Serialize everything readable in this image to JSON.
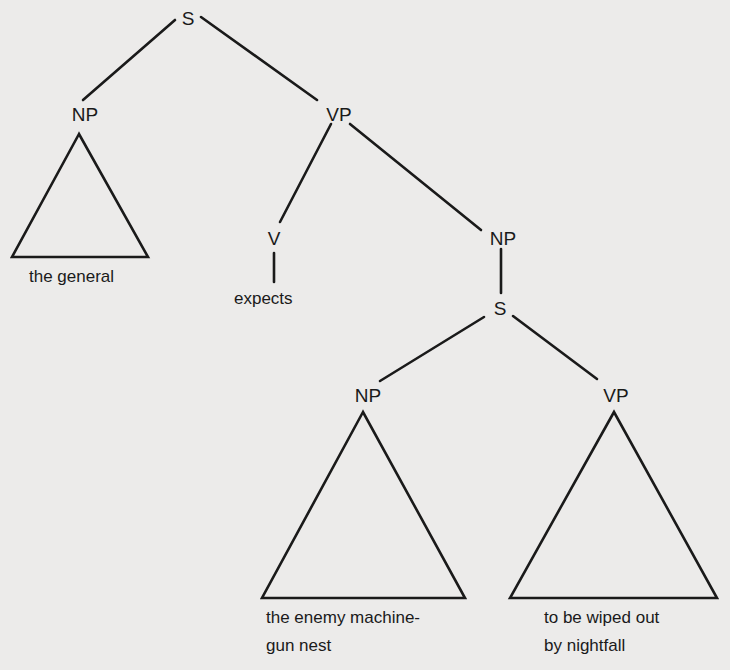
{
  "diagram": {
    "type": "syntax-tree",
    "background": "#ecebea",
    "ink": "#1a1a1a",
    "nodes": {
      "root_s": "S",
      "np_subject": "NP",
      "vp_main": "VP",
      "v": "V",
      "np_object": "NP",
      "s_embedded": "S",
      "np_embedded": "NP",
      "vp_embedded": "VP"
    },
    "leaves": {
      "np_subject": "the general",
      "v": "expects",
      "np_embedded_line1": "the enemy machine-",
      "np_embedded_line2": "gun nest",
      "vp_embedded_line1": "to be wiped out",
      "vp_embedded_line2": "by nightfall"
    },
    "edges": [
      [
        "S",
        "NP (subject)"
      ],
      [
        "S",
        "VP"
      ],
      [
        "VP",
        "V"
      ],
      [
        "VP",
        "NP (object)"
      ],
      [
        "V",
        "expects"
      ],
      [
        "NP (object)",
        "S (embedded)"
      ],
      [
        "S (embedded)",
        "NP (embedded)"
      ],
      [
        "S (embedded)",
        "VP (embedded)"
      ]
    ],
    "triangles": [
      "NP (subject)",
      "NP (embedded)",
      "VP (embedded)"
    ]
  }
}
